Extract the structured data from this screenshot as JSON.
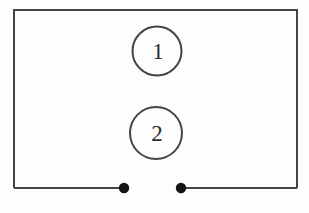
{
  "diagram": {
    "kind": "circuit-loop-with-open-terminals",
    "components": [
      {
        "label": "1",
        "shape": "circle"
      },
      {
        "label": "2",
        "shape": "circle"
      }
    ],
    "terminals": [
      {
        "position": "bottom-left-of-gap",
        "style": "filled-dot"
      },
      {
        "position": "bottom-right-of-gap",
        "style": "filled-dot"
      }
    ],
    "colors": {
      "wire": "#454545",
      "terminal_dot": "#141414",
      "label_text": "#2e2e2e",
      "background": "#fdfdfd"
    }
  }
}
